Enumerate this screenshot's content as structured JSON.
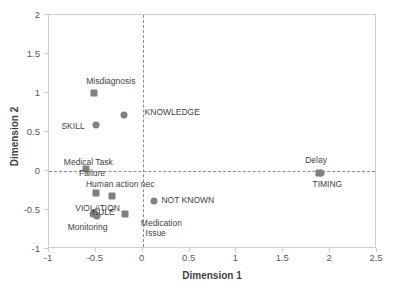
{
  "chart_data": {
    "type": "scatter",
    "title": "",
    "xlabel": "Dimension 1",
    "ylabel": "Dimension 2",
    "xlim": [
      -1,
      2.5
    ],
    "ylim": [
      -1,
      2
    ],
    "xticks": [
      "-1",
      "-0.5",
      "0",
      "0.5",
      "1",
      "1.5",
      "2",
      "2.5"
    ],
    "xtick_values": [
      -1,
      -0.5,
      0,
      0.5,
      1,
      1.5,
      2,
      2.5
    ],
    "yticks": [
      "-1",
      "-0.5",
      "0",
      "0.5",
      "1",
      "1.5",
      "2"
    ],
    "ytick_values": [
      -1,
      -0.5,
      0,
      0.5,
      1,
      1.5,
      2
    ],
    "grid": false,
    "legend": "none",
    "marker_color": "#808080",
    "reference_lines": {
      "horizontal": 0,
      "vertical": 0,
      "style": "dash-dot",
      "color": "#8d8d8d"
    },
    "series": [
      {
        "name": "Row points",
        "marker": "square",
        "points": [
          {
            "label": "Misdiagnosis",
            "x": -0.52,
            "y": 1.0
          },
          {
            "label": "Medical Task\nFailure",
            "x": -0.6,
            "y": 0.02
          },
          {
            "label": "Human action nec",
            "x": -0.5,
            "y": -0.28
          },
          {
            "label": "",
            "x": -0.33,
            "y": -0.32
          },
          {
            "label": "Medication\nIssue",
            "x": -0.19,
            "y": -0.55
          },
          {
            "label": "Delay",
            "x": 1.88,
            "y": -0.02
          }
        ]
      },
      {
        "name": "Column points",
        "marker": "circle",
        "points": [
          {
            "label": "KNOWLEDGE",
            "x": -0.2,
            "y": 0.72
          },
          {
            "label": "SKILL",
            "x": -0.5,
            "y": 0.59
          },
          {
            "label": "VIOLATION",
            "x": -0.53,
            "y": -0.55
          },
          {
            "label": "RULE",
            "x": -0.5,
            "y": -0.57
          },
          {
            "label": "Monitoring",
            "x": -0.49,
            "y": -0.58
          },
          {
            "label": "NOT KNOWN",
            "x": 0.12,
            "y": -0.38
          },
          {
            "label": "TIMING",
            "x": 1.9,
            "y": -0.02
          }
        ]
      }
    ],
    "annotations": [
      {
        "name": "misdiagnosis",
        "text": "Misdiagnosis",
        "x": -0.34,
        "y": 1.16,
        "anchor": "mid"
      },
      {
        "name": "knowledge",
        "text": "KNOWLEDGE",
        "x": 0.02,
        "y": 0.76,
        "anchor": "start"
      },
      {
        "name": "skill",
        "text": "SKILL",
        "x": -0.62,
        "y": 0.58,
        "anchor": "end"
      },
      {
        "name": "medical-task-failure-line1",
        "text": "Medical Task",
        "x": -0.58,
        "y": 0.12,
        "anchor": "mid"
      },
      {
        "name": "medical-task-failure-line2",
        "text": "Failure",
        "x": -0.54,
        "y": -0.03,
        "anchor": "mid"
      },
      {
        "name": "human-action-nec",
        "text": "Human action nec",
        "x": -0.24,
        "y": -0.17,
        "anchor": "mid"
      },
      {
        "name": "violation",
        "text": "VIOLATION",
        "x": -0.72,
        "y": -0.47,
        "anchor": "start"
      },
      {
        "name": "rule",
        "text": "RULE",
        "x": -0.42,
        "y": -0.53,
        "anchor": "mid"
      },
      {
        "name": "monitoring",
        "text": "Monitoring",
        "x": -0.8,
        "y": -0.72,
        "anchor": "start"
      },
      {
        "name": "not-known",
        "text": "NOT KNOWN",
        "x": 0.2,
        "y": -0.37,
        "anchor": "start"
      },
      {
        "name": "medication-issue-line1",
        "text": "Medication",
        "x": -0.02,
        "y": -0.67,
        "anchor": "start"
      },
      {
        "name": "medication-issue-line2",
        "text": "Issue",
        "x": 0.03,
        "y": -0.8,
        "anchor": "start"
      },
      {
        "name": "delay",
        "text": "Delay",
        "x": 1.85,
        "y": 0.14,
        "anchor": "mid"
      },
      {
        "name": "timing",
        "text": "TIMING",
        "x": 1.97,
        "y": -0.17,
        "anchor": "mid"
      }
    ]
  }
}
